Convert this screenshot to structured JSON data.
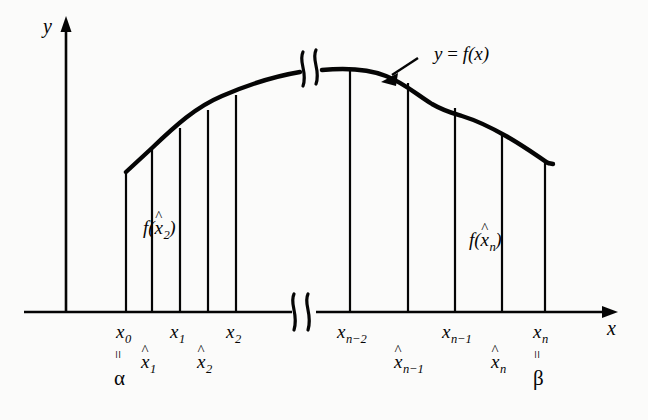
{
  "figure": {
    "type": "riemann-sum-diagram",
    "background": "#fbfbfa",
    "ink": "#050505",
    "axes": {
      "y_label": "y",
      "x_label": "x",
      "y_axis_x": 66,
      "x_axis_y": 312,
      "x_axis_end": 617,
      "y_axis_top": 20
    },
    "curve_label": {
      "text_y": "y",
      "text_eq": " = ",
      "text_f": "f",
      "text_arg": "(x)",
      "full": "y = f(x)"
    },
    "interior_labels": [
      {
        "f": "f",
        "open": "(",
        "hat": "^",
        "base": "x",
        "sub": "2",
        "close": ")",
        "full": "f(x̂2)",
        "x": 143,
        "y": 228
      },
      {
        "f": "f",
        "open": "(",
        "hat": "^",
        "base": "x",
        "sub": "n",
        "close": ")",
        "full": "f(x̂n)",
        "x": 469,
        "y": 240
      }
    ],
    "partition_points": [
      {
        "name": "x0",
        "base": "x",
        "sub": "0",
        "hat": false,
        "tick_x": 126,
        "label_x": 116,
        "label_y": 322,
        "equals": "=",
        "greek": "α"
      },
      {
        "name": "x1",
        "base": "x",
        "sub": "1",
        "hat": false,
        "tick_x": 180,
        "label_x": 170,
        "label_y": 322,
        "equals": "",
        "greek": ""
      },
      {
        "name": "x2",
        "base": "x",
        "sub": "2",
        "hat": false,
        "tick_x": 236,
        "label_x": 226,
        "label_y": 322,
        "equals": "",
        "greek": ""
      },
      {
        "name": "xn-2",
        "base": "x",
        "sub": "n−2",
        "hat": false,
        "tick_x": 350,
        "label_x": 337,
        "label_y": 322,
        "equals": "",
        "greek": ""
      },
      {
        "name": "xn-1",
        "base": "x",
        "sub": "n−1",
        "hat": false,
        "tick_x": 455,
        "label_x": 442,
        "label_y": 322,
        "equals": "",
        "greek": ""
      },
      {
        "name": "xn",
        "base": "x",
        "sub": "n",
        "hat": false,
        "tick_x": 545,
        "label_x": 533,
        "label_y": 322,
        "equals": "=",
        "greek": "β"
      }
    ],
    "sample_points": [
      {
        "name": "xhat1",
        "base": "x",
        "sub": "1",
        "tick_x": 152,
        "label_x": 141,
        "label_y": 352
      },
      {
        "name": "xhat2",
        "base": "x",
        "sub": "2",
        "tick_x": 208,
        "label_x": 197,
        "label_y": 352
      },
      {
        "name": "xhatn-1",
        "base": "x",
        "sub": "n−1",
        "tick_x": 408,
        "label_x": 394,
        "label_y": 352
      },
      {
        "name": "xhatn",
        "base": "x",
        "sub": "n",
        "tick_x": 502,
        "label_x": 491,
        "label_y": 352
      }
    ],
    "breaks": [
      {
        "name": "curve-break",
        "x": 310,
        "y": 70
      },
      {
        "name": "axis-break",
        "x": 298,
        "y": 312
      }
    ],
    "annotation_arrow": {
      "from_x": 416,
      "from_y": 60,
      "to_x": 385,
      "to_y": 80
    }
  }
}
